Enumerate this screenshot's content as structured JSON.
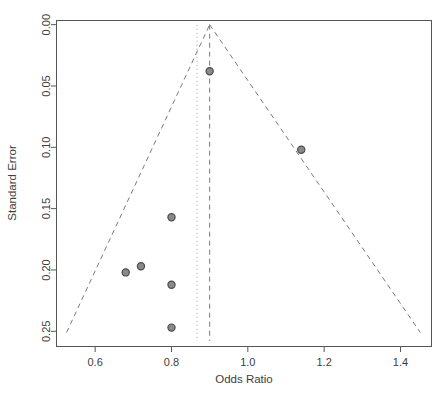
{
  "chart_data": {
    "type": "scatter",
    "title": "",
    "subtitle": "",
    "xlabel": "Odds Ratio",
    "ylabel": "Standard Error",
    "xlim": [
      0.5,
      1.48
    ],
    "ylim": [
      0.262,
      -0.003
    ],
    "y_axis_reversed": true,
    "grid": false,
    "legend": null,
    "xticks": [
      "0.6",
      "0.8",
      "1.0",
      "1.2",
      "1.4"
    ],
    "xtick_values": [
      0.6,
      0.8,
      1.0,
      1.2,
      1.4
    ],
    "yticks": [
      "0.00",
      "0.05",
      "0.10",
      "0.15",
      "0.20",
      "0.25"
    ],
    "ytick_values": [
      0.0,
      0.05,
      0.1,
      0.15,
      0.2,
      0.25
    ],
    "x": [
      0.9,
      1.14,
      0.8,
      0.8,
      0.72,
      0.68,
      0.8
    ],
    "y": [
      0.038,
      0.102,
      0.157,
      0.212,
      0.197,
      0.202,
      0.247
    ],
    "points": [
      {
        "odds_ratio": 0.9,
        "standard_error": 0.038
      },
      {
        "odds_ratio": 1.14,
        "standard_error": 0.102
      },
      {
        "odds_ratio": 0.8,
        "standard_error": 0.157
      },
      {
        "odds_ratio": 0.8,
        "standard_error": 0.212
      },
      {
        "odds_ratio": 0.72,
        "standard_error": 0.197
      },
      {
        "odds_ratio": 0.68,
        "standard_error": 0.202
      },
      {
        "odds_ratio": 0.8,
        "standard_error": 0.247
      }
    ],
    "annotations": {
      "funnel_apex_odds_ratio": 0.9,
      "funnel_left_base_odds_ratio": 0.525,
      "funnel_right_base_odds_ratio": 1.452,
      "funnel_base_standard_error": 0.251,
      "center_line_odds_ratio": 0.9,
      "secondary_reference_line_odds_ratio": 0.867
    },
    "colors": {
      "point_fill": "#8a8a8a",
      "point_stroke": "#4a4a4a",
      "funnel_line": "#7a7a7a",
      "reference_line": "#b9b9b9",
      "axis": "#565656",
      "text": "#3d3d3d",
      "background": "#ffffff"
    }
  },
  "axes": {
    "x_title": "Odds Ratio",
    "y_title": "Standard Error"
  }
}
